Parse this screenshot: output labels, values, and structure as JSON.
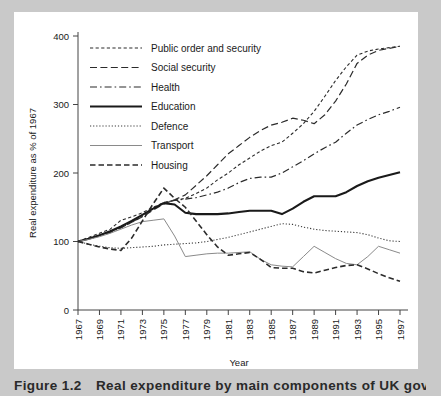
{
  "figure": {
    "caption_number": "Figure 1.2",
    "caption_text": "Real expenditure by main components of UK government"
  },
  "chart_data": {
    "type": "line",
    "title": "",
    "xlabel": "Year",
    "ylabel": "Real expenditure as % of 1967",
    "xlim": [
      1967,
      1997
    ],
    "ylim": [
      0,
      400
    ],
    "yticks": [
      0,
      100,
      200,
      300,
      400
    ],
    "xticks": [
      1967,
      1969,
      1971,
      1973,
      1975,
      1977,
      1979,
      1981,
      1983,
      1985,
      1987,
      1989,
      1991,
      1993,
      1995,
      1997
    ],
    "grid": false,
    "legend_position": "top-left-inside",
    "x": [
      1967,
      1968,
      1969,
      1970,
      1971,
      1972,
      1973,
      1974,
      1975,
      1976,
      1977,
      1978,
      1979,
      1980,
      1981,
      1982,
      1983,
      1984,
      1985,
      1986,
      1987,
      1988,
      1989,
      1990,
      1991,
      1992,
      1993,
      1994,
      1995,
      1996,
      1997
    ],
    "series": [
      {
        "name": "Public order and security",
        "style": "dotted-dash",
        "color": "#2b2b2b",
        "values": [
          100,
          106,
          112,
          118,
          131,
          136,
          142,
          150,
          157,
          160,
          163,
          170,
          178,
          190,
          200,
          212,
          222,
          232,
          240,
          245,
          258,
          272,
          290,
          312,
          335,
          355,
          372,
          378,
          381,
          383,
          385
        ]
      },
      {
        "name": "Social security",
        "style": "long-dash",
        "color": "#2b2b2b",
        "values": [
          100,
          104,
          109,
          114,
          120,
          128,
          136,
          146,
          155,
          161,
          168,
          182,
          196,
          212,
          228,
          240,
          252,
          262,
          270,
          274,
          280,
          277,
          272,
          285,
          305,
          330,
          360,
          372,
          379,
          382,
          385
        ]
      },
      {
        "name": "Health",
        "style": "dash-dot",
        "color": "#2b2b2b",
        "values": [
          100,
          104,
          108,
          113,
          120,
          128,
          137,
          148,
          157,
          160,
          162,
          164,
          168,
          172,
          178,
          186,
          192,
          194,
          194,
          200,
          209,
          218,
          228,
          237,
          245,
          258,
          270,
          278,
          285,
          290,
          296
        ]
      },
      {
        "name": "Education",
        "style": "solid-thick",
        "color": "#1a1a1a",
        "values": [
          100,
          104,
          109,
          115,
          122,
          130,
          139,
          148,
          156,
          154,
          142,
          140,
          140,
          140,
          141,
          143,
          145,
          145,
          145,
          140,
          148,
          158,
          166,
          166,
          166,
          172,
          181,
          188,
          193,
          197,
          201
        ]
      },
      {
        "name": "Defence",
        "style": "dotted",
        "color": "#3a3a3a",
        "values": [
          100,
          96,
          93,
          91,
          90,
          91,
          92,
          93,
          95,
          96,
          97,
          98,
          100,
          103,
          106,
          110,
          114,
          118,
          122,
          126,
          125,
          121,
          118,
          116,
          115,
          114,
          113,
          110,
          105,
          101,
          100
        ]
      },
      {
        "name": "Transport",
        "style": "solid-thin",
        "color": "#8a8a8a",
        "values": [
          100,
          103,
          107,
          112,
          118,
          124,
          129,
          131,
          133,
          108,
          78,
          80,
          82,
          83,
          83,
          84,
          85,
          74,
          66,
          64,
          63,
          78,
          93,
          84,
          75,
          68,
          66,
          78,
          93,
          88,
          83
        ]
      },
      {
        "name": "Housing",
        "style": "dashed",
        "color": "#2b2b2b",
        "values": [
          100,
          96,
          92,
          89,
          87,
          105,
          130,
          155,
          178,
          163,
          150,
          130,
          110,
          92,
          80,
          82,
          84,
          74,
          62,
          61,
          61,
          56,
          54,
          58,
          62,
          65,
          66,
          60,
          53,
          47,
          42
        ]
      }
    ]
  }
}
